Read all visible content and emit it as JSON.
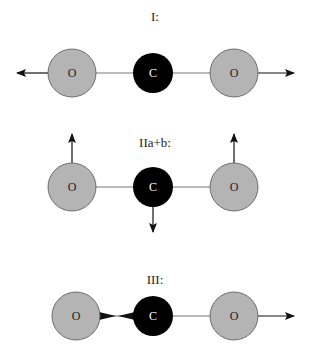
{
  "modes": [
    {
      "label": "I:",
      "name": "symmetric-stretch",
      "atoms": [
        "O",
        "C",
        "O"
      ]
    },
    {
      "label": "IIa+b:",
      "name": "bending",
      "atoms": [
        "O",
        "C",
        "O"
      ]
    },
    {
      "label": "III:",
      "name": "asymmetric-stretch",
      "atoms": [
        "O",
        "C",
        "O"
      ]
    }
  ],
  "colors": {
    "oxygen": "#b4b4b4",
    "carbon": "#000000",
    "arrow": "#111111",
    "bond": "#777777"
  }
}
